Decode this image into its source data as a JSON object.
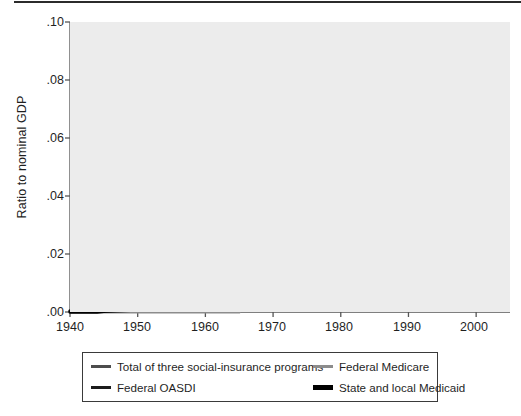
{
  "chart_data": {
    "type": "line",
    "title": "",
    "xlabel": "",
    "ylabel": "Ratio to nominal GDP",
    "xlim": [
      1940,
      2005
    ],
    "ylim": [
      0.0,
      0.1
    ],
    "grid": true,
    "grid_color": "#ffffff",
    "plot_background": "#ececec",
    "legend_position": "below-plot",
    "xticks": [
      1940,
      1950,
      1960,
      1970,
      1980,
      1990,
      2000
    ],
    "xtick_labels": [
      "1940",
      "1950",
      "1960",
      "1970",
      "1980",
      "1990",
      "2000"
    ],
    "yticks": [
      0.0,
      0.02,
      0.04,
      0.06,
      0.08,
      0.1
    ],
    "ytick_labels": [
      ".00",
      ".02",
      ".04",
      ".06",
      ".08",
      ".10"
    ],
    "x": [
      1940,
      1941,
      1942,
      1943,
      1944,
      1945,
      1946,
      1947,
      1948,
      1949,
      1950,
      1951,
      1952,
      1953,
      1954,
      1955,
      1956,
      1957,
      1958,
      1959,
      1960,
      1961,
      1962,
      1963,
      1964,
      1965,
      1966,
      1967,
      1968,
      1969,
      1970,
      1971,
      1972,
      1973,
      1974,
      1975,
      1976,
      1977,
      1978,
      1979,
      1980,
      1981,
      1982,
      1983,
      1984,
      1985,
      1986,
      1987,
      1988,
      1989,
      1990,
      1991,
      1992,
      1993,
      1994,
      1995,
      1996,
      1997,
      1998,
      1999,
      2000,
      2001,
      2002,
      2003,
      2004
    ],
    "series": [
      {
        "name": "Total of three social-insurance programs",
        "color": "#4d4d4d",
        "width": 3.0,
        "values": [
          0.0004,
          0.0005,
          0.0005,
          0.0006,
          0.0007,
          0.0008,
          0.0012,
          0.0016,
          0.0018,
          0.0022,
          0.003,
          0.0042,
          0.0052,
          0.0062,
          0.0074,
          0.009,
          0.0108,
          0.0124,
          0.0152,
          0.017,
          0.0193,
          0.0215,
          0.0235,
          0.0241,
          0.024,
          0.0245,
          0.027,
          0.0305,
          0.032,
          0.0322,
          0.0345,
          0.039,
          0.042,
          0.043,
          0.0468,
          0.0545,
          0.0575,
          0.057,
          0.056,
          0.0558,
          0.06,
          0.063,
          0.07,
          0.0715,
          0.07,
          0.0698,
          0.0695,
          0.069,
          0.0682,
          0.069,
          0.0715,
          0.079,
          0.084,
          0.0855,
          0.0858,
          0.087,
          0.0888,
          0.0875,
          0.0855,
          0.0838,
          0.083,
          0.086,
          0.09,
          0.0915,
          0.0918
        ]
      },
      {
        "name": "Federal OASDI",
        "color": "#1c1c1c",
        "width": 3.0,
        "values": [
          0.0004,
          0.0005,
          0.0005,
          0.0006,
          0.0007,
          0.0008,
          0.0012,
          0.0016,
          0.0018,
          0.0022,
          0.003,
          0.0042,
          0.0052,
          0.0062,
          0.0074,
          0.009,
          0.0108,
          0.0124,
          0.0152,
          0.017,
          0.0193,
          0.0215,
          0.0235,
          0.0238,
          0.0236,
          0.0238,
          0.025,
          0.0262,
          0.0272,
          0.027,
          0.029,
          0.032,
          0.034,
          0.0355,
          0.0368,
          0.0402,
          0.0408,
          0.0405,
          0.04,
          0.0398,
          0.0418,
          0.0432,
          0.0465,
          0.045,
          0.0432,
          0.0428,
          0.0424,
          0.0418,
          0.0412,
          0.0415,
          0.0425,
          0.044,
          0.0452,
          0.045,
          0.0448,
          0.045,
          0.0448,
          0.044,
          0.0428,
          0.0418,
          0.041,
          0.0418,
          0.0428,
          0.0422,
          0.0415
        ]
      },
      {
        "name": "Federal Medicare",
        "color": "#8c8c8c",
        "width": 3.0,
        "values": [
          0.0,
          0.0,
          0.0,
          0.0,
          0.0,
          0.0,
          0.0,
          0.0,
          0.0,
          0.0,
          0.0,
          0.0,
          0.0,
          0.0,
          0.0,
          0.0,
          0.0,
          0.0,
          0.0,
          0.0,
          0.0,
          0.0,
          0.0,
          0.0,
          0.0,
          0.0,
          0.0028,
          0.0062,
          0.0065,
          0.0063,
          0.0066,
          0.007,
          0.0073,
          0.0076,
          0.0084,
          0.0096,
          0.0102,
          0.0108,
          0.011,
          0.0114,
          0.0125,
          0.0133,
          0.0146,
          0.0155,
          0.0154,
          0.0156,
          0.0158,
          0.016,
          0.0162,
          0.0172,
          0.018,
          0.0192,
          0.0204,
          0.0212,
          0.0222,
          0.0232,
          0.024,
          0.0238,
          0.0228,
          0.0222,
          0.022,
          0.023,
          0.0242,
          0.0248,
          0.0252
        ]
      },
      {
        "name": "State and local Medicaid",
        "color": "#000000",
        "width": 3.4,
        "values": [
          0.0,
          0.0,
          0.0,
          0.0,
          0.0,
          0.0002,
          0.0003,
          0.0004,
          0.0005,
          0.0006,
          0.0007,
          0.0008,
          0.0009,
          0.001,
          0.0011,
          0.0012,
          0.0013,
          0.0014,
          0.0016,
          0.0018,
          0.002,
          0.0022,
          0.0024,
          0.0026,
          0.0028,
          0.003,
          0.0034,
          0.0042,
          0.0048,
          0.0052,
          0.0058,
          0.0064,
          0.007,
          0.0074,
          0.008,
          0.0088,
          0.0084,
          0.0082,
          0.008,
          0.008,
          0.0084,
          0.0088,
          0.009,
          0.009,
          0.0088,
          0.009,
          0.0094,
          0.0098,
          0.0104,
          0.0116,
          0.013,
          0.0156,
          0.018,
          0.0192,
          0.0198,
          0.0202,
          0.0204,
          0.02,
          0.0194,
          0.0198,
          0.0208,
          0.0222,
          0.0234,
          0.024,
          0.0242
        ]
      }
    ]
  },
  "axes": {
    "ylabel": "Ratio to nominal GDP",
    "ytick_labels": [
      ".10",
      ".08",
      ".06",
      ".04",
      ".02",
      ".00"
    ],
    "xtick_labels": [
      "1940",
      "1950",
      "1960",
      "1970",
      "1980",
      "1990",
      "2000"
    ]
  },
  "legend": {
    "items": [
      {
        "label": "Total of three social-insurance programs",
        "color": "#4d4d4d"
      },
      {
        "label": "Federal Medicare",
        "color": "#8c8c8c"
      },
      {
        "label": "Federal OASDI",
        "color": "#1c1c1c"
      },
      {
        "label": "State and local Medicaid",
        "color": "#000000"
      }
    ]
  }
}
